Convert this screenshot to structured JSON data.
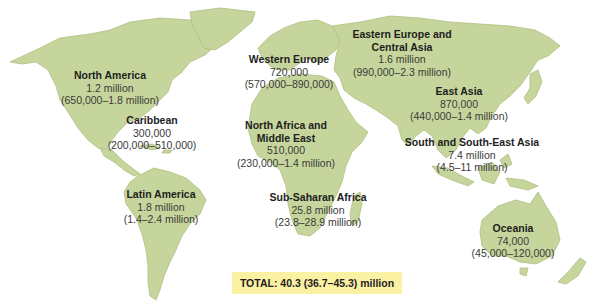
{
  "map": {
    "land_color": "#c6d59c",
    "background_color": "#ffffff",
    "total_box_color": "#fbf1a3"
  },
  "regions": {
    "north_america": {
      "name": "North America",
      "value": "1.2 million",
      "range": "(650,000–1.8 million)"
    },
    "caribbean": {
      "name": "Caribbean",
      "value": "300,000",
      "range": "(200,000–510,000)"
    },
    "latin_america": {
      "name": "Latin America",
      "value": "1.8 million",
      "range": "(1.4–2.4 million)"
    },
    "western_europe": {
      "name": "Western Europe",
      "value": "720,000",
      "range": "(570,000–890,000)"
    },
    "north_africa_middle_east": {
      "name_line1": "North Africa and",
      "name_line2": "Middle East",
      "value": "510,000",
      "range": "(230,000–1.4 million)"
    },
    "sub_saharan_africa": {
      "name": "Sub-Saharan Africa",
      "value": "25.8 million",
      "range": "(23.8–28.9 million)"
    },
    "eastern_europe_central_asia": {
      "name_line1": "Eastern Europe and",
      "name_line2": "Central Asia",
      "value": "1.6 million",
      "range": "(990,000–2.3 million)"
    },
    "east_asia": {
      "name": "East Asia",
      "value": "870,000",
      "range": "(440,000–1.4 million)"
    },
    "south_southeast_asia": {
      "name": "South and South-East Asia",
      "value": "7.4 million",
      "range": "(4.5–11 million)"
    },
    "oceania": {
      "name": "Oceania",
      "value": "74,000",
      "range": "(45,000–120,000)"
    }
  },
  "total": {
    "label": "TOTAL: 40.3 (36.7–45.3) million"
  }
}
